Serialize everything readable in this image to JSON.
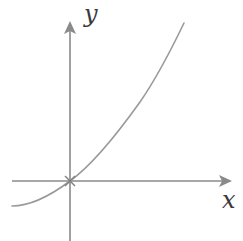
{
  "diagram": {
    "type": "function-sketch",
    "axes": {
      "x_label": "x",
      "y_label": "y"
    },
    "origin_marker": "cross",
    "curve": {
      "description": "increasing curve passing through the origin, concave down to the left of the y-axis, steepening to the upper right",
      "passes_through_origin": true
    },
    "colors": {
      "axis": "#8a8a8a",
      "curve": "#9a9a9a",
      "label": "#3a3a3a",
      "background": "#ffffff"
    }
  }
}
